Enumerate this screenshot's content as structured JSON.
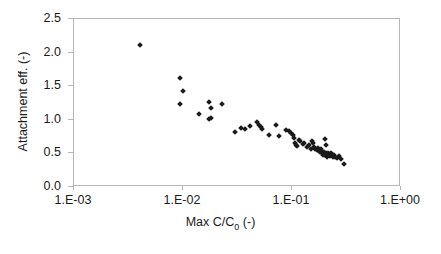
{
  "chart_data": {
    "type": "scatter",
    "title": "",
    "xlabel": "Max C/C0 (-)",
    "xlabel_parts": {
      "pre": "Max C/C",
      "sub": "0",
      "post": " (-)"
    },
    "ylabel": "Attachment eff. (-)",
    "xscale": "log",
    "yscale": "linear",
    "xlim": [
      0.001,
      1.0
    ],
    "ylim": [
      0.0,
      2.5
    ],
    "grid": false,
    "legend": null,
    "marker": "diamond",
    "marker_color": "#1a1a1a",
    "xticks": [
      0.001,
      0.01,
      0.1,
      1.0
    ],
    "xtick_labels": [
      "1.E-03",
      "1.E-02",
      "1.E-01",
      "1.E+00"
    ],
    "yticks": [
      0.0,
      0.5,
      1.0,
      1.5,
      2.0,
      2.5
    ],
    "ytick_labels": [
      "0.0",
      "0.5",
      "1.0",
      "1.5",
      "2.0",
      "2.5"
    ],
    "series": [
      {
        "name": "data",
        "points": [
          [
            0.004,
            2.11
          ],
          [
            0.0093,
            1.62
          ],
          [
            0.01,
            1.43
          ],
          [
            0.0094,
            1.23
          ],
          [
            0.0175,
            1.26
          ],
          [
            0.0182,
            1.18
          ],
          [
            0.023,
            1.23
          ],
          [
            0.014,
            1.09
          ],
          [
            0.0172,
            1.01
          ],
          [
            0.018,
            1.03
          ],
          [
            0.03,
            0.82
          ],
          [
            0.034,
            0.88
          ],
          [
            0.037,
            0.87
          ],
          [
            0.041,
            0.91
          ],
          [
            0.048,
            0.97
          ],
          [
            0.05,
            0.93
          ],
          [
            0.0515,
            0.89
          ],
          [
            0.053,
            0.86
          ],
          [
            0.062,
            0.77
          ],
          [
            0.072,
            0.93
          ],
          [
            0.076,
            0.76
          ],
          [
            0.088,
            0.85
          ],
          [
            0.093,
            0.83
          ],
          [
            0.098,
            0.8
          ],
          [
            0.103,
            0.78
          ],
          [
            0.105,
            0.73
          ],
          [
            0.107,
            0.66
          ],
          [
            0.109,
            0.63
          ],
          [
            0.11,
            0.61
          ],
          [
            0.115,
            0.7
          ],
          [
            0.118,
            0.68
          ],
          [
            0.125,
            0.64
          ],
          [
            0.13,
            0.66
          ],
          [
            0.138,
            0.59
          ],
          [
            0.142,
            0.62
          ],
          [
            0.148,
            0.57
          ],
          [
            0.152,
            0.68
          ],
          [
            0.156,
            0.66
          ],
          [
            0.16,
            0.6
          ],
          [
            0.164,
            0.57
          ],
          [
            0.168,
            0.55
          ],
          [
            0.172,
            0.58
          ],
          [
            0.176,
            0.54
          ],
          [
            0.18,
            0.52
          ],
          [
            0.183,
            0.56
          ],
          [
            0.186,
            0.53
          ],
          [
            0.19,
            0.5
          ],
          [
            0.193,
            0.48
          ],
          [
            0.196,
            0.52
          ],
          [
            0.199,
            0.49
          ],
          [
            0.202,
            0.47
          ],
          [
            0.205,
            0.51
          ],
          [
            0.208,
            0.48
          ],
          [
            0.21,
            0.45
          ],
          [
            0.213,
            0.5
          ],
          [
            0.216,
            0.47
          ],
          [
            0.2,
            0.72
          ],
          [
            0.205,
            0.62
          ],
          [
            0.22,
            0.49
          ],
          [
            0.225,
            0.46
          ],
          [
            0.23,
            0.51
          ],
          [
            0.235,
            0.47
          ],
          [
            0.24,
            0.44
          ],
          [
            0.245,
            0.48
          ],
          [
            0.25,
            0.45
          ],
          [
            0.26,
            0.43
          ],
          [
            0.27,
            0.46
          ],
          [
            0.28,
            0.41
          ],
          [
            0.3,
            0.34
          ]
        ]
      }
    ]
  }
}
